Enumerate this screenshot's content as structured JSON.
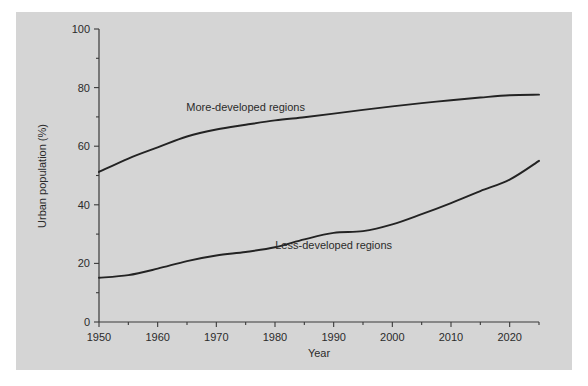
{
  "chart_data": {
    "type": "line",
    "title": "",
    "xlabel": "Year",
    "ylabel": "Urban population (%)",
    "xlim": [
      1950,
      2025
    ],
    "ylim": [
      0,
      100
    ],
    "xticks": [
      1950,
      1960,
      1970,
      1980,
      1990,
      2000,
      2010,
      2020
    ],
    "xtick_labels": [
      "1950",
      "1960",
      "1970",
      "1980",
      "1990",
      "2000",
      "2010",
      "2020"
    ],
    "x_minor_ticks": [
      1955,
      1965,
      1975,
      1985,
      1995,
      2005,
      2015,
      2025
    ],
    "yticks": [
      0,
      20,
      40,
      60,
      80,
      100
    ],
    "ytick_labels": [
      "0",
      "20",
      "40",
      "60",
      "80",
      "100"
    ],
    "y_minor_ticks": [
      10,
      30,
      50,
      70,
      90
    ],
    "grid": false,
    "legend_position": "inline-annotations",
    "x": [
      1950,
      1955,
      1960,
      1965,
      1970,
      1975,
      1980,
      1985,
      1990,
      1995,
      2000,
      2005,
      2010,
      2015,
      2020,
      2025
    ],
    "series": [
      {
        "name": "More-developed regions",
        "label_x": 1975,
        "label_y": 72,
        "values": [
          51.2,
          55.8,
          59.6,
          63.3,
          65.7,
          67.3,
          68.8,
          69.9,
          71.1,
          72.4,
          73.6,
          74.7,
          75.7,
          76.6,
          77.4,
          77.6
        ]
      },
      {
        "name": "Less-developed regions",
        "label_x": 1990,
        "label_y": 25,
        "values": [
          15.1,
          16.0,
          18.2,
          20.8,
          22.7,
          23.9,
          25.5,
          28.2,
          30.4,
          31.0,
          33.3,
          36.8,
          40.6,
          44.7,
          48.6,
          55.0
        ]
      }
    ],
    "colors": {
      "panel_background": "#d5d5d5",
      "page_background": "#ffffff",
      "axis": "#3a3a3a",
      "line": "#232323",
      "text": "#2b2b2b"
    }
  }
}
